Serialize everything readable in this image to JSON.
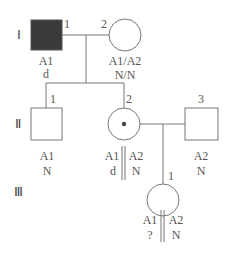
{
  "diagram": {
    "type": "pedigree",
    "generations": [
      {
        "label": "Ⅰ"
      },
      {
        "label": "Ⅱ"
      },
      {
        "label": "Ⅲ"
      }
    ],
    "individuals": {
      "I1": {
        "number": "1",
        "sex": "male",
        "affected": true,
        "genotype": "A1",
        "allele": "d"
      },
      "I2": {
        "number": "2",
        "sex": "female",
        "affected": false,
        "genotype": "A1/A2",
        "allele": "N/N"
      },
      "II1": {
        "number": "1",
        "sex": "male",
        "affected": false,
        "genotype": "A1",
        "allele": "N"
      },
      "II2": {
        "number": "2",
        "sex": "female",
        "carrier": true,
        "haplotype_left": "A1",
        "haplotype_right": "A2",
        "allele_left": "d",
        "allele_right": "N"
      },
      "II3": {
        "number": "3",
        "sex": "male",
        "affected": false,
        "genotype": "A2",
        "allele": "N"
      },
      "III1": {
        "number": "1",
        "sex": "female",
        "affected": false,
        "haplotype_left": "A1",
        "haplotype_right": "A2",
        "allele_left": "?",
        "allele_right": "N"
      }
    },
    "colors": {
      "line": "#777777",
      "affected_fill": "#3a3a3a",
      "text": "#555555"
    }
  }
}
